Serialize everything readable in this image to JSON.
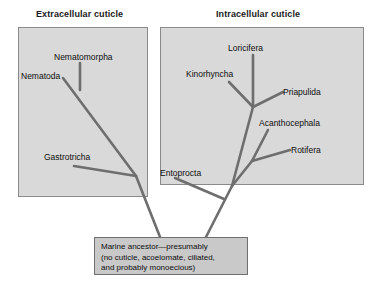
{
  "figure": {
    "type": "phylogenetic-tree-diagram",
    "panels": [
      {
        "id": "extracellular",
        "title": "Extracellular cuticle",
        "taxa": [
          "Nematomorpha",
          "Nematoda",
          "Gastrotricha"
        ]
      },
      {
        "id": "intracellular",
        "title": "Intracellular cuticle",
        "taxa": [
          "Loricifera",
          "Kinorhyncha",
          "Priapulida",
          "Acanthocephala",
          "Rotifera",
          "Entoprocta"
        ]
      }
    ],
    "labels": {
      "nematomorpha": "Nematomorpha",
      "nematoda": "Nematoda",
      "gastrotricha": "Gastrotricha",
      "loricifera": "Loricifera",
      "kinorhyncha": "Kinorhyncha",
      "priapulida": "Priapulida",
      "acanthocephala": "Acanthocephala",
      "rotifera": "Rotifera",
      "entoprocta": "Entoprocta"
    },
    "caption": {
      "line1": "Marine ancestor—presumably",
      "line2": "(no cuticle, acoelomate, ciliated,",
      "line3": "and probably monoecious)"
    },
    "colors": {
      "panel_fill": "#d9d9d9",
      "panel_border": "#8a8a8a",
      "branch": "#6e6e6e",
      "caption_fill": "#c9c9c9",
      "caption_border": "#6f6f6f",
      "text": "#0d0d0d",
      "background": "#ffffff"
    }
  }
}
